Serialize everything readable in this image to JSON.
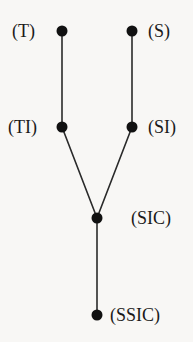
{
  "diagram": {
    "type": "tree",
    "background_color": "#f8f7f5",
    "node_color": "#111111",
    "edge_color": "#2a2a2a",
    "node_radius": 5.5,
    "edge_width": 1.6,
    "nodes": [
      {
        "id": "T",
        "label": "(T)",
        "x": 62,
        "y": 31,
        "label_x": 12,
        "label_y": 22,
        "label_side": "left"
      },
      {
        "id": "S",
        "label": "(S)",
        "x": 132,
        "y": 31,
        "label_x": 148,
        "label_y": 22,
        "label_side": "right"
      },
      {
        "id": "TI",
        "label": "(TI)",
        "x": 62,
        "y": 127,
        "label_x": 8,
        "label_y": 118,
        "label_side": "left"
      },
      {
        "id": "SI",
        "label": "(SI)",
        "x": 132,
        "y": 127,
        "label_x": 148,
        "label_y": 118,
        "label_side": "right"
      },
      {
        "id": "SIC",
        "label": "(SIC)",
        "x": 97,
        "y": 218,
        "label_x": 131,
        "label_y": 209,
        "label_side": "right"
      },
      {
        "id": "SSIC",
        "label": "(SSIC)",
        "x": 97,
        "y": 315,
        "label_x": 110,
        "label_y": 306,
        "label_side": "right"
      }
    ],
    "edges": [
      {
        "from": "T",
        "to": "TI",
        "x1": 62,
        "y1": 31,
        "x2": 62,
        "y2": 127
      },
      {
        "from": "S",
        "to": "SI",
        "x1": 132,
        "y1": 31,
        "x2": 132,
        "y2": 127
      },
      {
        "from": "TI",
        "to": "SIC",
        "x1": 62,
        "y1": 127,
        "x2": 97,
        "y2": 218
      },
      {
        "from": "SI",
        "to": "SIC",
        "x1": 132,
        "y1": 127,
        "x2": 97,
        "y2": 218
      },
      {
        "from": "SIC",
        "to": "SSIC",
        "x1": 97,
        "y1": 218,
        "x2": 97,
        "y2": 315
      }
    ]
  }
}
